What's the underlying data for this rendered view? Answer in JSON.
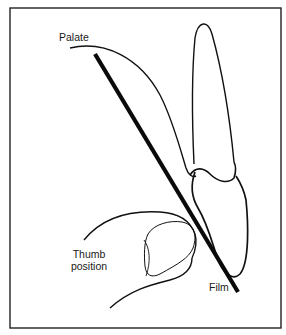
{
  "diagram": {
    "type": "dental radiography illustration",
    "labels": {
      "palate": "Palate",
      "thumb_line1": "Thumb",
      "thumb_line2": "position",
      "film": "Film"
    },
    "colors": {
      "stroke": "#111111",
      "background": "#ffffff",
      "text": "#1a1a1a"
    }
  }
}
